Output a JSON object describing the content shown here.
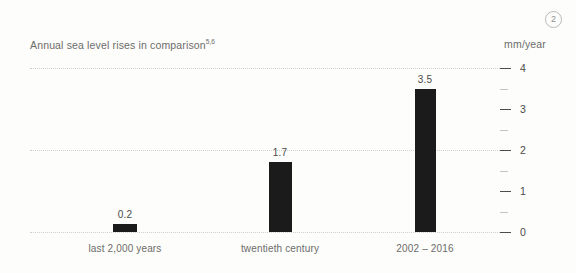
{
  "badge": {
    "label": "2"
  },
  "header": {
    "title": "Annual sea level rises in comparison",
    "title_superscript": "5,6",
    "unit": "mm/year"
  },
  "chart_data": {
    "type": "bar",
    "title": "Annual sea level rises in comparison",
    "xlabel": "",
    "ylabel": "mm/year",
    "categories": [
      "last 2,000 years",
      "twentieth century",
      "2002 – 2016"
    ],
    "values": [
      0.2,
      1.7,
      3.5
    ],
    "value_labels": [
      "0.2",
      "1.7",
      "3.5"
    ],
    "ylim": [
      0,
      4
    ],
    "ytick_labels": [
      "0",
      "1",
      "2",
      "3",
      "4"
    ],
    "ytick_values": [
      0,
      1,
      2,
      3,
      4
    ],
    "minor_tick_values": [
      0.5,
      1.5,
      2.5,
      3.5
    ],
    "gridline_values": [
      0,
      2,
      4
    ],
    "grid": true,
    "legend": "none",
    "bar_color": "#1b1b1b",
    "grid_color": "#cfcfcc",
    "text_color": "#6c6c6a"
  }
}
